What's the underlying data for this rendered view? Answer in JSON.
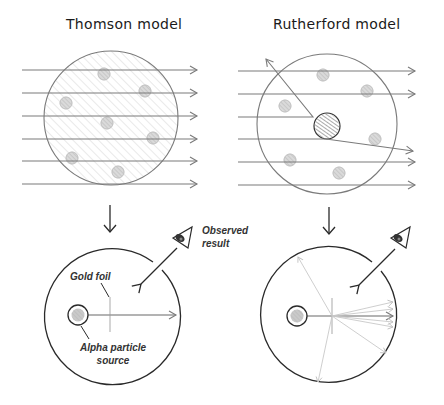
{
  "panels": {
    "thomson": {
      "title": "Thomson model"
    },
    "rutherford": {
      "title": "Rutherford model"
    }
  },
  "labels": {
    "gold_foil": "Gold foil",
    "alpha_source_line1": "Alpha particle",
    "alpha_source_line2": "source",
    "observed_line1": "Observed",
    "observed_line2": "result"
  },
  "icons": [
    "eye-icon",
    "down-arrow-icon",
    "eye-icon",
    "down-arrow-icon"
  ],
  "colors": {
    "stroke_dark": "#2a2a2a",
    "stroke_mid": "#7a7a7a",
    "stroke_light": "#c8c8c8",
    "electron_fill": "#d8d8d8",
    "hatch": "#cfcfcf"
  }
}
